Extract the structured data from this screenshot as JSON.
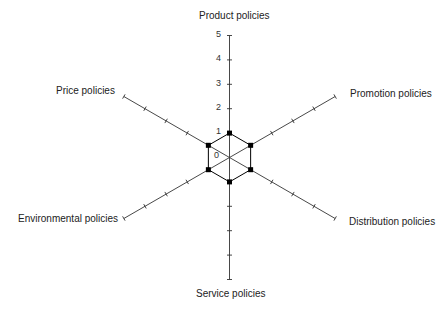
{
  "chart_data": {
    "type": "radar",
    "title": "",
    "axes": [
      "Product policies",
      "Promotion policies",
      "Distribution policies",
      "Service policies",
      "Environmental policies",
      "Price policies"
    ],
    "scale": {
      "min": 0,
      "max": 5,
      "ticks": [
        0,
        1,
        2,
        3,
        4,
        5
      ],
      "tick_labels_on_axis": "Product policies"
    },
    "series": [
      {
        "name": "",
        "values": [
          1,
          1,
          1,
          1,
          1,
          1
        ],
        "marker": "square",
        "color": "#000000"
      }
    ],
    "grid": false,
    "legend": "none"
  },
  "labels": {
    "product": "Product policies",
    "promotion": "Promotion policies",
    "distribution": "Distribution policies",
    "service": "Service policies",
    "environmental": "Environmental policies",
    "price": "Price policies"
  },
  "ticks": {
    "t0": "0",
    "t1": "1",
    "t2": "2",
    "t3": "3",
    "t4": "4",
    "t5": "5"
  },
  "colors": {
    "axis": "#333333",
    "series": "#000000"
  }
}
